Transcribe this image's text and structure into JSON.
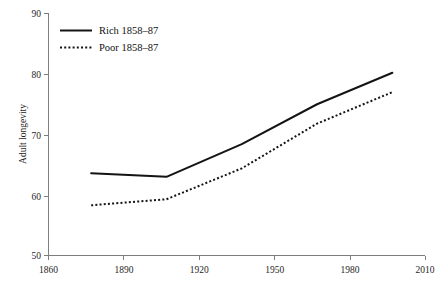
{
  "chart_data": {
    "type": "line",
    "title": "",
    "xlabel": "",
    "ylabel": "Adult longevity",
    "xlim": [
      1860,
      2010
    ],
    "ylim": [
      50,
      90
    ],
    "grid": false,
    "legend_position": "top-left",
    "x_ticks": [
      1860,
      1890,
      1920,
      1950,
      1980,
      2010
    ],
    "x_tick_labels": [
      "1860",
      "1890",
      "1920",
      "1950",
      "1980",
      "2010"
    ],
    "y_ticks": [
      50,
      60,
      70,
      80,
      90
    ],
    "y_tick_labels": [
      "50",
      "60",
      "70",
      "80",
      "90"
    ],
    "series": [
      {
        "name": "Rich 1858–87",
        "style": "solid",
        "x": [
          1877,
          1907,
          1937,
          1967,
          1997
        ],
        "values": [
          63.6,
          63.0,
          68.4,
          75.0,
          80.2
        ]
      },
      {
        "name": "Poor 1858–87",
        "style": "dotted",
        "x": [
          1877,
          1907,
          1937,
          1967,
          1997
        ],
        "values": [
          58.3,
          59.3,
          64.4,
          71.8,
          77.0
        ]
      }
    ]
  },
  "legend": {
    "entries": [
      {
        "label": "Rich 1858–87",
        "style": "solid"
      },
      {
        "label": "Poor 1858–87",
        "style": "dotted"
      }
    ]
  },
  "axes": {
    "y_title": "Adult longevity",
    "y_labels": {
      "t0": "50",
      "t1": "60",
      "t2": "70",
      "t3": "80",
      "t4": "90"
    },
    "x_labels": {
      "t0": "1860",
      "t1": "1890",
      "t2": "1920",
      "t3": "1950",
      "t4": "1980",
      "t5": "2010"
    }
  },
  "colors": {
    "line": "#141414",
    "axis": "#7d7d7d",
    "text": "#1a1a1a",
    "background": "#ffffff"
  }
}
